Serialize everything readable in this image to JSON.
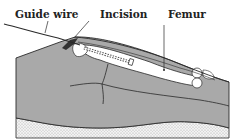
{
  "figure": {
    "labels": {
      "guide_wire": "Guide wire",
      "incision": "Incision",
      "femur": "Femur"
    },
    "colors": {
      "skin": "#a9a9a9",
      "bone": "#ffffff",
      "outline": "#2a2a2a",
      "table": "#e6e6e6"
    }
  }
}
